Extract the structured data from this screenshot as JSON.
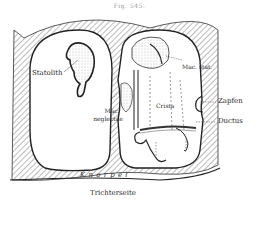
{
  "figure": {
    "title": "Fig. 545.",
    "labels": {
      "statolith": "Statolith",
      "mac_neglectae_1": "Mac.",
      "mac_neglectae_2": "neglectae",
      "crista": "Crista",
      "mac_stat": "Mac. stat.",
      "zapfen": "Zapfen",
      "ductus": "Ductus",
      "knorpel": "K n o r p e l",
      "trichterseite": "Trichterseite"
    }
  }
}
